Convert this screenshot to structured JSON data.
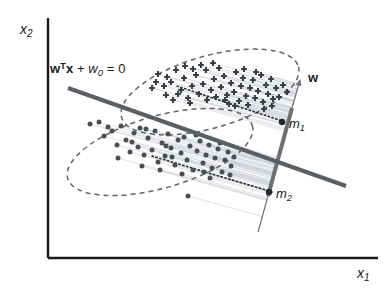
{
  "figure": {
    "title_visible": false,
    "background_color": "#ffffff"
  },
  "axes": {
    "x_label": "x",
    "x_label_sub": "1",
    "y_label": "x",
    "y_label_sub": "2",
    "color": "#1a1a1a",
    "origin": {
      "x": 48,
      "y": 258
    },
    "x_axis_end": {
      "x": 378,
      "y": 258
    },
    "y_axis_top": {
      "x": 48,
      "y": 18
    }
  },
  "annotations": {
    "equation": {
      "w_bold": "w",
      "transpose": "T",
      "x_bold": "x",
      "plus": " + ",
      "w0": "w",
      "w0_sub": "0",
      "equals": " = 0"
    },
    "w_vector_label": "w",
    "mean1_label": "m",
    "mean1_sub": "1",
    "mean2_label": "m",
    "mean2_sub": "2"
  },
  "colors": {
    "axis": "#1a1a1a",
    "decision_boundary": "#5a5f66",
    "projection_axis": "#6b7077",
    "ellipse": "#5f646b",
    "class1_marker": "#3a3f45",
    "class2_marker": "#4a4f56",
    "projection_ray": "#c9cdd2",
    "dotted_axis": "#2b2f34"
  },
  "chart_data": {
    "type": "scatter",
    "title": "",
    "xlabel": "x1",
    "ylabel": "x2",
    "grid": false,
    "legend_position": "none",
    "lines": [
      {
        "name": "decision-boundary",
        "label": "wTx + w0 = 0",
        "from": [
          68,
          88
        ],
        "to": [
          346,
          186
        ],
        "width": 4,
        "color": "#5a5f66"
      },
      {
        "name": "projection-axis",
        "label": "w",
        "from": [
          258,
          232
        ],
        "to": [
          300,
          80
        ],
        "width": 3.6,
        "color": "#6b7077",
        "arrow": true
      }
    ],
    "ellipses": [
      {
        "name": "class1-ellipse",
        "cx": 210,
        "cy": 92,
        "rx": 92,
        "ry": 36,
        "rotation": -16,
        "style": "dashed"
      },
      {
        "name": "class2-ellipse",
        "cx": 160,
        "cy": 152,
        "rx": 96,
        "ry": 36,
        "rotation": -16,
        "style": "dashed"
      }
    ],
    "mean_points": [
      {
        "name": "m1",
        "x": 282,
        "y": 122,
        "label": "m1"
      },
      {
        "name": "m2",
        "x": 269,
        "y": 192,
        "label": "m2"
      }
    ],
    "series": [
      {
        "name": "class-1",
        "marker": "plus",
        "color": "#3a3f45",
        "points": [
          [
            152,
            88
          ],
          [
            158,
            74
          ],
          [
            166,
            95
          ],
          [
            171,
            82
          ],
          [
            176,
            70
          ],
          [
            173,
            100
          ],
          [
            181,
            90
          ],
          [
            184,
            78
          ],
          [
            188,
            98
          ],
          [
            185,
            66
          ],
          [
            192,
            86
          ],
          [
            196,
            75
          ],
          [
            199,
            94
          ],
          [
            203,
            84
          ],
          [
            206,
            70
          ],
          [
            207,
            100
          ],
          [
            211,
            90
          ],
          [
            214,
            79
          ],
          [
            216,
            97
          ],
          [
            219,
            68
          ],
          [
            221,
            87
          ],
          [
            224,
            76
          ],
          [
            227,
            95
          ],
          [
            229,
            104
          ],
          [
            231,
            83
          ],
          [
            234,
            92
          ],
          [
            236,
            72
          ],
          [
            239,
            101
          ],
          [
            241,
            86
          ],
          [
            243,
            78
          ],
          [
            246,
            96
          ],
          [
            248,
            105
          ],
          [
            250,
            88
          ],
          [
            253,
            80
          ],
          [
            255,
            98
          ],
          [
            258,
            91
          ],
          [
            261,
            75
          ],
          [
            263,
            102
          ],
          [
            266,
            85
          ],
          [
            268,
            94
          ],
          [
            271,
            79
          ],
          [
            273,
            99
          ],
          [
            276,
            88
          ],
          [
            156,
            82
          ],
          [
            164,
            86
          ],
          [
            178,
            94
          ],
          [
            190,
            103
          ],
          [
            201,
            65
          ],
          [
            213,
            63
          ],
          [
            225,
            100
          ],
          [
            235,
            106
          ],
          [
            244,
            69
          ],
          [
            256,
            72
          ],
          [
            264,
            109
          ],
          [
            272,
            106
          ],
          [
            279,
            97
          ],
          [
            283,
            85
          ],
          [
            287,
            92
          ],
          [
            167,
            77
          ],
          [
            193,
            69
          ]
        ]
      },
      {
        "name": "class-2",
        "marker": "circle",
        "color": "#4a4f56",
        "points": [
          [
            90,
            124
          ],
          [
            99,
            122
          ],
          [
            104,
            136
          ],
          [
            112,
            131
          ],
          [
            117,
            145
          ],
          [
            121,
            126
          ],
          [
            126,
            140
          ],
          [
            130,
            152
          ],
          [
            134,
            133
          ],
          [
            138,
            147
          ],
          [
            140,
            128
          ],
          [
            144,
            155
          ],
          [
            148,
            138
          ],
          [
            152,
            150
          ],
          [
            155,
            131
          ],
          [
            158,
            162
          ],
          [
            162,
            143
          ],
          [
            165,
            156
          ],
          [
            168,
            134
          ],
          [
            171,
            148
          ],
          [
            175,
            165
          ],
          [
            178,
            140
          ],
          [
            181,
            153
          ],
          [
            184,
            137
          ],
          [
            187,
            160
          ],
          [
            190,
            146
          ],
          [
            193,
            170
          ],
          [
            197,
            151
          ],
          [
            200,
            141
          ],
          [
            203,
            163
          ],
          [
            206,
            155
          ],
          [
            209,
            145
          ],
          [
            212,
            168
          ],
          [
            215,
            158
          ],
          [
            218,
            149
          ],
          [
            222,
            172
          ],
          [
            225,
            160
          ],
          [
            228,
            152
          ],
          [
            231,
            166
          ],
          [
            234,
            157
          ],
          [
            188,
            196
          ],
          [
            108,
            127
          ],
          [
            132,
            142
          ],
          [
            146,
            129
          ],
          [
            160,
            170
          ],
          [
            172,
            157
          ],
          [
            196,
            135
          ],
          [
            210,
            178
          ],
          [
            220,
            143
          ],
          [
            230,
            175
          ],
          [
            118,
            158
          ],
          [
            142,
            166
          ],
          [
            166,
            146
          ],
          [
            182,
            174
          ],
          [
            204,
            172
          ]
        ]
      }
    ]
  }
}
